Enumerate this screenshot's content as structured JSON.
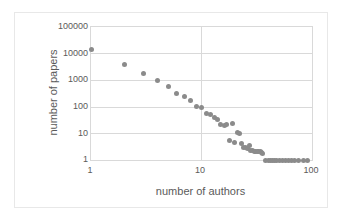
{
  "chart_data": {
    "type": "scatter",
    "title": "",
    "xlabel": "number of authors",
    "ylabel": "number of papers",
    "xscale": "log",
    "yscale": "log",
    "xlim": [
      1,
      100
    ],
    "ylim": [
      1,
      100000
    ],
    "xticks": [
      "1",
      "10",
      "100"
    ],
    "xtick_values": [
      1,
      10,
      100
    ],
    "yticks": [
      "1",
      "10",
      "100",
      "1000",
      "10000",
      "100000"
    ],
    "ytick_values": [
      1,
      10,
      100,
      1000,
      10000,
      100000
    ],
    "grid": true,
    "grid_axis": "y",
    "legend": "none",
    "marker_color": "#8b8b8b",
    "marker_shape": "circle",
    "x": [
      1,
      2,
      3,
      4,
      5,
      6,
      7,
      8,
      9,
      10,
      11,
      12,
      13,
      14,
      15,
      16,
      17,
      18,
      19,
      20,
      21,
      22,
      23,
      24,
      25,
      26,
      27,
      28,
      29,
      30,
      31,
      32,
      33,
      34,
      35,
      36,
      38,
      40,
      42,
      44,
      46,
      48,
      51,
      54,
      57,
      61,
      65,
      70,
      76,
      83,
      91
    ],
    "y": [
      14000,
      3800,
      1800,
      950,
      560,
      310,
      250,
      170,
      100,
      95,
      55,
      50,
      40,
      33,
      22,
      20,
      21,
      5.5,
      23,
      4.5,
      11,
      10,
      4.2,
      3.0,
      2.9,
      2.6,
      3.6,
      2.2,
      2.3,
      2.0,
      2.1,
      2.1,
      2.0,
      2.0,
      1.9,
      1.8,
      1,
      1,
      1,
      1,
      1,
      1,
      1,
      1,
      1,
      1,
      1,
      1,
      1,
      1,
      1
    ]
  },
  "figure": {
    "background_color": "#ffffff",
    "border_color": "#e8e8e8",
    "axis_color": "#d9d9d9",
    "text_color": "#5a5a5a"
  }
}
